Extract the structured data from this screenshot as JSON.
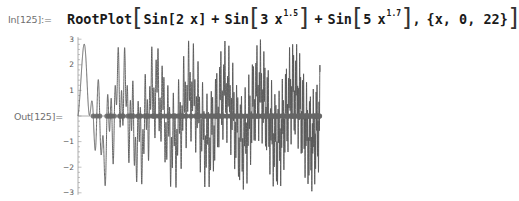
{
  "notebook": {
    "input_label": "In[125]:=",
    "output_label": "Out[125]=",
    "input": {
      "function_name": "RootPlot",
      "terms": [
        {
          "head": "Sin",
          "arg_coef": "2",
          "arg_var": "x",
          "exponent": ""
        },
        {
          "head": "Sin",
          "arg_coef": "3",
          "arg_var": "x",
          "exponent": "1.5"
        },
        {
          "head": "Sin",
          "arg_coef": "5",
          "arg_var": "x",
          "exponent": "1.7"
        }
      ],
      "plus": "+",
      "range_text": "{x, 0, 22}",
      "comma": ","
    }
  },
  "chart_data": {
    "type": "line",
    "title": "",
    "function": "Sin[2 x] + Sin[3 x^1.5] + Sin[5 x^1.7]",
    "series": [
      {
        "name": "f(x)",
        "expression": "sin(2x)+sin(3x^1.5)+sin(5x^1.7)",
        "color": "#555555"
      }
    ],
    "roots_marker": {
      "description": "roots of f(x) marked as points on the x-axis",
      "color": "#666666"
    },
    "x": {
      "min": 0,
      "max": 22
    },
    "xlim": [
      0,
      22
    ],
    "ylim": [
      -3,
      3
    ],
    "yticks": [
      -3,
      -2,
      -1,
      1,
      2,
      3
    ],
    "xlabel": "",
    "ylabel": "",
    "grid": false,
    "legend": false
  },
  "colors": {
    "curve": "#555555",
    "roots": "#6a6a6a",
    "axis": "#999999",
    "label": "#6f6f6f",
    "code": "#1a1a1a"
  }
}
